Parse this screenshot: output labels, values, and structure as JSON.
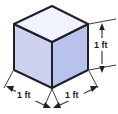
{
  "figure": {
    "type": "geometry-diagram",
    "shape_name": "cube",
    "background_color": "#ffffff",
    "faces": {
      "top": {
        "name": "top-face",
        "fill_color": "#f1f3fa",
        "points": "52,6 88,24 52,42 14,24"
      },
      "left": {
        "name": "front-left-face",
        "fill_color": "#ccd2ee",
        "points": "14,24 52,42 52,88 14,70"
      },
      "right": {
        "name": "front-right-face",
        "fill_color": "#b9c2ea",
        "points": "52,42 88,24 88,70 52,88"
      }
    },
    "edge_color": "#20202c",
    "dimension_line_color": "#3a3a46",
    "labels": {
      "height_right": "1 ft",
      "width_bottom_left": "1 ft",
      "depth_bottom_right": "1 ft"
    }
  }
}
